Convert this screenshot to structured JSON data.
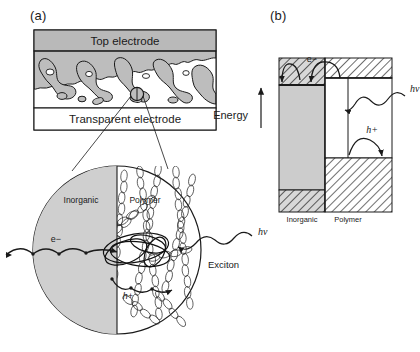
{
  "figure": {
    "panels": [
      {
        "id": "a",
        "label": "(a)",
        "type": "device-cross-section-with-magnified-inset",
        "device_stack": {
          "top_layer_label": "Top electrode",
          "bottom_layer_label": "Transparent electrode",
          "active_layer_description": "interpenetrating bulk heterojunction network of inorganic and polymer phases"
        },
        "magnified_circle": {
          "left_region_label": "Inorganic",
          "right_region_label": "Polymer",
          "annotations": [
            {
              "name": "electron",
              "label": "e−",
              "description": "electron hopping through inorganic phase"
            },
            {
              "name": "hole",
              "label": "h+",
              "description": "hole hopping along polymer chains"
            },
            {
              "name": "exciton",
              "label": "Exciton",
              "description": "bound electron-hole pair at interface"
            },
            {
              "name": "photon",
              "label": "hν",
              "description": "incident photon"
            }
          ]
        }
      },
      {
        "id": "b",
        "label": "(b)",
        "type": "energy-band-diagram",
        "axis_label": "Energy",
        "axis_direction": "up",
        "materials": [
          {
            "name": "Inorganic",
            "label": "Inorganic"
          },
          {
            "name": "Polymer",
            "label": "Polymer"
          }
        ],
        "annotations": [
          {
            "name": "electron-transfer",
            "label": "e−",
            "description": "electron transfer from polymer LUMO to inorganic conduction band"
          },
          {
            "name": "hole-transfer",
            "label": "h+",
            "description": "hole transfer to polymer HOMO"
          },
          {
            "name": "photon-absorption",
            "label": "hν",
            "description": "photon absorption creating exciton in polymer"
          }
        ]
      }
    ]
  },
  "colors": {
    "electrode_gray": "#b9b9b9",
    "network_gray": "#bdbdbd",
    "inorganic_gray": "#cfcfcf",
    "band_gray": "#cccccc",
    "line_black": "#1a1a1a",
    "hatch_gray": "#6f6f6f"
  }
}
